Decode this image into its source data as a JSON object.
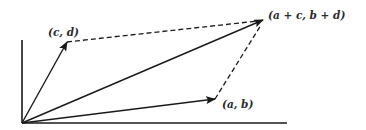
{
  "diagram": {
    "colors": {
      "stroke": "#1a1a1a",
      "background": "#ffffff",
      "label": "#2a2a2a"
    },
    "origin": {
      "x": 22,
      "y": 123
    },
    "axes": {
      "x_axis": {
        "from": [
          22,
          123
        ],
        "to": [
          287,
          123
        ]
      },
      "y_axis": {
        "from": [
          22,
          123
        ],
        "to": [
          22,
          40
        ]
      }
    },
    "vectors": [
      {
        "id": "v-cd",
        "label": "(c, d)",
        "from": [
          22,
          123
        ],
        "to": [
          67,
          42
        ],
        "style": "solid-arrow"
      },
      {
        "id": "v-ab",
        "label": "(a, b)",
        "from": [
          22,
          123
        ],
        "to": [
          215,
          99
        ],
        "style": "solid-arrow"
      },
      {
        "id": "v-sum",
        "label": "(a + c, b + d)",
        "from": [
          22,
          123
        ],
        "to": [
          263,
          20
        ],
        "style": "solid-arrow"
      }
    ],
    "dashed_edges": [
      {
        "id": "edge-cd-to-sum",
        "from": [
          67,
          42
        ],
        "to": [
          263,
          20
        ]
      },
      {
        "id": "edge-ab-to-sum",
        "from": [
          215,
          99
        ],
        "to": [
          263,
          20
        ]
      }
    ],
    "labels": {
      "cd": "(c, d)",
      "ab": "(a, b)",
      "sum": "(a + c, b + d)"
    }
  }
}
